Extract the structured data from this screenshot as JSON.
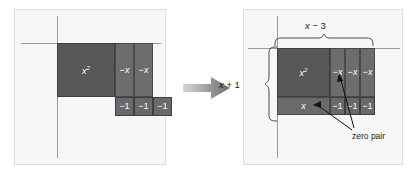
{
  "figure": {
    "type": "algebra-tiles-diagram",
    "arrow": "right-arrow"
  },
  "colors": {
    "panel_bg": "#f7f7f7",
    "panel_border": "#dedede",
    "axis": "#9a9a9a",
    "tile_x2": "#575757",
    "tile_negx": "#6d6d6d",
    "tile_neg1": "#696969",
    "tile_x": "#6a6a6a",
    "tile_text": "#ffffff",
    "label_text": "#1c1c1c",
    "arrow": "#6b6b6b"
  },
  "left_panel": {
    "name": "before-rearrangement",
    "tiles": [
      {
        "id": "x2",
        "label_base": "x",
        "label_sup": "2",
        "kind": "x-squared"
      },
      {
        "id": "negx1",
        "label": "−x",
        "kind": "negative-x"
      },
      {
        "id": "negx2",
        "label": "−x",
        "kind": "negative-x"
      },
      {
        "id": "neg1a",
        "label": "−1",
        "kind": "negative-one"
      },
      {
        "id": "neg1b",
        "label": "−1",
        "kind": "negative-one"
      },
      {
        "id": "neg1c",
        "label": "−1",
        "kind": "negative-one"
      }
    ]
  },
  "right_panel": {
    "name": "after-rearrangement",
    "width_label": {
      "var": "x",
      "op": " − ",
      "num": "3",
      "full": "x − 3"
    },
    "height_label": {
      "var": "x",
      "op": " + ",
      "num": "1",
      "full": "x + 1"
    },
    "annotation": "zero pair",
    "tiles": [
      {
        "id": "x2",
        "label_base": "x",
        "label_sup": "2",
        "kind": "x-squared"
      },
      {
        "id": "negx1",
        "label": "−x",
        "kind": "negative-x"
      },
      {
        "id": "negx2",
        "label": "−x",
        "kind": "negative-x"
      },
      {
        "id": "negx3",
        "label": "−x",
        "kind": "negative-x"
      },
      {
        "id": "x",
        "label": "x",
        "kind": "positive-x"
      },
      {
        "id": "neg1a",
        "label": "−1",
        "kind": "negative-one"
      },
      {
        "id": "neg1b",
        "label": "−1",
        "kind": "negative-one"
      },
      {
        "id": "neg1c",
        "label": "−1",
        "kind": "negative-one"
      }
    ]
  }
}
